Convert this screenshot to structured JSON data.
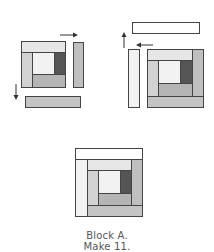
{
  "diagram": {
    "type": "quilt-block-assembly",
    "steps": [
      {
        "step": 1,
        "description": "Add right strip and bottom strip to partial block",
        "arrows": [
          "right",
          "down"
        ]
      },
      {
        "step": 2,
        "description": "Add left strip and top strip",
        "arrows": [
          "up",
          "left"
        ]
      },
      {
        "step": 3,
        "description": "Finished block"
      }
    ],
    "caption": {
      "line1": "Block A.",
      "line2": "Make 11."
    },
    "colors": {
      "outline": "#444444",
      "white": "#ffffff",
      "very_light": "#f2f2f2",
      "light": "#e6e6e6",
      "light_gray": "#d2d2d2",
      "mid_gray": "#bcbcbc",
      "medium": "#b0b0b0",
      "dark": "#555555",
      "arrow": "#333333"
    }
  }
}
